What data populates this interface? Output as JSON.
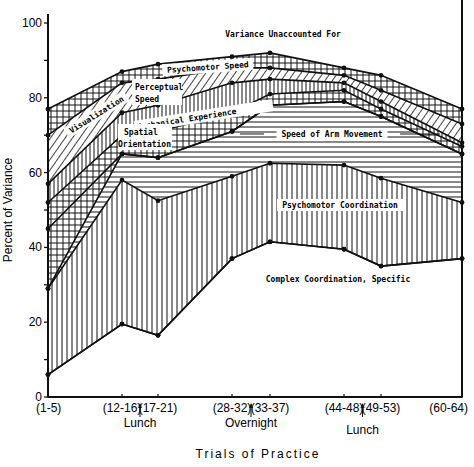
{
  "chart_data": {
    "type": "area",
    "stacked": true,
    "title": "",
    "xlabel": "Trials of Practice",
    "ylabel": "Percent of Variance",
    "ylim": [
      0,
      100
    ],
    "yticks": [
      0,
      20,
      40,
      60,
      80,
      100
    ],
    "categories": [
      "(1-5)",
      "(12-16)",
      "(17-21)",
      "(28-32)",
      "(33-37)",
      "(44-48)",
      "(49-53)",
      "(60-64)"
    ],
    "annotations": [
      {
        "between": [
          "(12-16)",
          "(17-21)"
        ],
        "label": "Lunch"
      },
      {
        "between": [
          "(28-32)",
          "(33-37)"
        ],
        "label": "Overnight"
      },
      {
        "between": [
          "(44-48)",
          "(49-53)"
        ],
        "label": "Lunch"
      }
    ],
    "boundaries_cumulative": {
      "base": [
        6,
        19.5,
        16.5,
        37,
        41.5,
        39.5,
        35,
        37
      ],
      "psychomotor_coordination_top": [
        29,
        58,
        52.5,
        59,
        62.5,
        62,
        58.5,
        52
      ],
      "spatial_orientation_top": [
        45,
        65,
        64,
        71,
        78,
        79,
        75,
        65
      ],
      "mechanical_experience_top": [
        52,
        70,
        71,
        76,
        81,
        82,
        77,
        67
      ],
      "perceptual_speed_top": [
        57,
        76,
        78,
        84,
        85,
        84,
        79,
        68
      ],
      "speed_of_arm_movement_note": "Speed of Arm Movement occupies band between psychomotor coordination and spatial orientation region",
      "visualization_top": [
        70,
        84,
        85,
        88,
        88,
        86,
        82,
        73
      ],
      "psychomotor_speed_top": [
        77,
        87,
        89,
        91,
        92,
        88,
        86,
        77
      ]
    },
    "series": [
      {
        "name": "Complex Coordination, Specific",
        "values": [
          6,
          19.5,
          16.5,
          37,
          41.5,
          39.5,
          35,
          37
        ]
      },
      {
        "name": "Psychomotor Coordination",
        "values": [
          23,
          38.5,
          36,
          22,
          21,
          22.5,
          23.5,
          15
        ]
      },
      {
        "name": "Speed of Arm Movement",
        "values": [
          0,
          7,
          11.5,
          12,
          15.5,
          17,
          16.5,
          13
        ]
      },
      {
        "name": "Spatial Orientation",
        "values": [
          16,
          0,
          0,
          0,
          0,
          0,
          0,
          0
        ]
      },
      {
        "name": "Mechanical Experience",
        "values": [
          7,
          5,
          7,
          5,
          3,
          3,
          2,
          2
        ]
      },
      {
        "name": "Perceptual Speed",
        "values": [
          5,
          6,
          7,
          8,
          4,
          2,
          2,
          1
        ]
      },
      {
        "name": "Visualization",
        "values": [
          13,
          8,
          7,
          4,
          3,
          2,
          3,
          5
        ]
      },
      {
        "name": "Psychomotor Speed",
        "values": [
          7,
          3,
          4,
          3,
          4,
          2,
          4,
          4
        ]
      },
      {
        "name": "Variance Unaccounted For",
        "values": [
          23,
          13,
          11,
          9,
          8,
          12,
          14,
          23
        ]
      }
    ],
    "band_labels": [
      "Variance Unaccounted For",
      "Psychomotor Speed",
      "Visualization",
      "Perceptual Speed",
      "Mechanical Experience",
      "Spatial Orientation",
      "Speed of Arm Movement",
      "Psychomotor Coordination",
      "Complex Coordination, Specific"
    ],
    "grid": false,
    "legend": "inline"
  }
}
